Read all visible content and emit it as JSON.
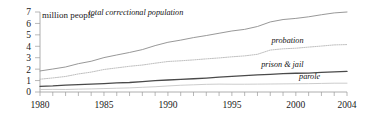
{
  "chart_data": {
    "type": "line",
    "title": "",
    "subtitle": "",
    "xlabel": "",
    "ylabel": "million people",
    "ylim": [
      0,
      7
    ],
    "xlim": [
      1980,
      2004
    ],
    "grid": false,
    "legend_position": "inline-right",
    "y_ticks": [
      "0",
      "1",
      "2",
      "3",
      "4",
      "5",
      "6",
      "7"
    ],
    "y_tick_values": [
      0,
      1,
      2,
      3,
      4,
      5,
      6,
      7
    ],
    "x_ticks": [
      "1980",
      "1985",
      "1990",
      "1995",
      "2000",
      "2004"
    ],
    "x_tick_values": [
      1980,
      1985,
      1990,
      1995,
      2000,
      2004
    ],
    "x_minor_tick_interval": 1,
    "x": [
      1980,
      1981,
      1982,
      1983,
      1984,
      1985,
      1986,
      1987,
      1988,
      1989,
      1990,
      1991,
      1992,
      1993,
      1994,
      1995,
      1996,
      1997,
      1998,
      1999,
      2000,
      2001,
      2002,
      2003,
      2004
    ],
    "series": [
      {
        "name": "total correctional population",
        "label": "total correctional population",
        "color": "#8c8c8c",
        "style": "solid",
        "width": 0.9,
        "values": [
          1.84,
          2.01,
          2.19,
          2.48,
          2.69,
          3.01,
          3.24,
          3.46,
          3.71,
          4.06,
          4.35,
          4.54,
          4.76,
          4.94,
          5.14,
          5.34,
          5.48,
          5.73,
          6.13,
          6.34,
          6.44,
          6.58,
          6.76,
          6.92,
          7.0
        ],
        "label_x": 1991.2,
        "label_y": 6.78
      },
      {
        "name": "probation",
        "label": "probation",
        "color": "#b8b8b8",
        "style": "dotted",
        "width": 0.9,
        "values": [
          1.12,
          1.23,
          1.36,
          1.58,
          1.74,
          1.97,
          2.11,
          2.25,
          2.36,
          2.52,
          2.67,
          2.73,
          2.81,
          2.9,
          2.98,
          3.08,
          3.16,
          3.3,
          3.67,
          3.78,
          3.83,
          3.93,
          4.02,
          4.12,
          4.15
        ],
        "label_x": 2000.6,
        "label_y": 4.33
      },
      {
        "name": "prison & jail",
        "label": "prison & jail",
        "color": "#4a4a4a",
        "style": "solid",
        "width": 1.3,
        "values": [
          0.5,
          0.54,
          0.61,
          0.65,
          0.69,
          0.74,
          0.79,
          0.83,
          0.9,
          0.99,
          1.05,
          1.1,
          1.16,
          1.22,
          1.3,
          1.37,
          1.43,
          1.49,
          1.55,
          1.6,
          1.64,
          1.66,
          1.72,
          1.76,
          1.8
        ],
        "label_x": 2000.6,
        "label_y": 2.22
      },
      {
        "name": "parole",
        "label": "parole",
        "color": "#c6c6c6",
        "style": "solid",
        "width": 0.9,
        "values": [
          0.22,
          0.23,
          0.22,
          0.25,
          0.27,
          0.3,
          0.33,
          0.36,
          0.41,
          0.46,
          0.53,
          0.59,
          0.63,
          0.67,
          0.69,
          0.68,
          0.68,
          0.69,
          0.7,
          0.71,
          0.72,
          0.73,
          0.75,
          0.77,
          0.77
        ],
        "label_x": 2001.9,
        "label_y": 1.12
      }
    ]
  },
  "axis": {
    "y_caption": "million people"
  }
}
